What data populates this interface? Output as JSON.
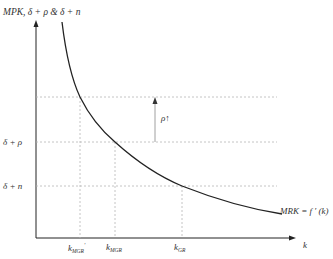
{
  "figure": {
    "y_axis_label": "MPK, δ + ρ & δ + n",
    "x_axis_label": "k",
    "curve_label": "MRK = f ′ (k)",
    "annotation": "ρ↑",
    "horizontal_lines": [
      {
        "label": "",
        "y": 97
      },
      {
        "label": "δ + ρ",
        "y": 142
      },
      {
        "label": "δ + n",
        "y": 186
      }
    ],
    "k_labels": [
      {
        "base": "k",
        "sub": "MGR",
        "sup": "′"
      },
      {
        "base": "k",
        "sub": "MGR",
        "sup": ""
      },
      {
        "base": "k",
        "sub": "GR",
        "sup": ""
      }
    ]
  },
  "colors": {
    "axis": "#222222",
    "curve": "#222222",
    "dashed": "#b5b5b5",
    "text": "#333333"
  }
}
